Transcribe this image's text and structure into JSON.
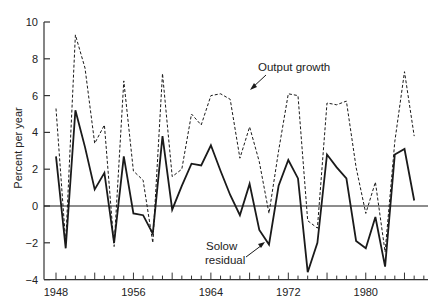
{
  "chart_data": {
    "type": "line",
    "title": "",
    "xlabel": "",
    "ylabel": "Percent per year",
    "xlim": [
      1948,
      1986
    ],
    "ylim": [
      -4,
      10
    ],
    "yticks": [
      -4,
      -2,
      0,
      2,
      4,
      6,
      8,
      10
    ],
    "xticks_labeled": [
      1948,
      1956,
      1964,
      1972,
      1980
    ],
    "grid": false,
    "zero_line": true,
    "legend_position": "inline annotations",
    "annotations": [
      {
        "text": "Output growth",
        "points_to": "dashed series"
      },
      {
        "text": "Solow\nresidual",
        "points_to": "solid series"
      }
    ],
    "x": [
      1948,
      1949,
      1950,
      1951,
      1952,
      1953,
      1954,
      1955,
      1956,
      1957,
      1958,
      1959,
      1960,
      1961,
      1962,
      1963,
      1964,
      1965,
      1966,
      1967,
      1968,
      1969,
      1970,
      1971,
      1972,
      1973,
      1974,
      1975,
      1976,
      1977,
      1978,
      1979,
      1980,
      1981,
      1982,
      1983,
      1984,
      1985
    ],
    "series": [
      {
        "name": "Output growth",
        "style": "dashed",
        "values": [
          5.3,
          -2.0,
          9.3,
          7.5,
          3.4,
          4.4,
          -2.2,
          6.8,
          1.9,
          1.4,
          -2.0,
          7.2,
          1.6,
          2.0,
          5.0,
          4.4,
          6.0,
          6.1,
          5.8,
          2.6,
          4.3,
          2.4,
          -0.4,
          3.0,
          6.1,
          6.0,
          -0.8,
          -1.2,
          5.6,
          5.5,
          5.7,
          2.1,
          -0.4,
          1.3,
          -2.5,
          3.5,
          7.3,
          3.8
        ]
      },
      {
        "name": "Solow residual",
        "style": "solid",
        "values": [
          2.7,
          -2.3,
          5.2,
          3.2,
          0.9,
          1.8,
          -2.0,
          2.7,
          -0.4,
          -0.5,
          -1.5,
          3.8,
          -0.2,
          1.1,
          2.3,
          2.2,
          3.3,
          1.9,
          0.6,
          -0.5,
          1.2,
          -1.3,
          -2.1,
          1.1,
          2.5,
          1.5,
          -3.6,
          -2.0,
          2.8,
          2.1,
          1.5,
          -1.9,
          -2.3,
          -0.6,
          -3.3,
          2.8,
          3.1,
          0.3
        ]
      }
    ]
  },
  "axes": {
    "y_label": "Percent per year",
    "y_tick_labels": [
      "10",
      "8",
      "6",
      "4",
      "2",
      "0",
      "−2",
      "−4"
    ],
    "x_tick_labels": [
      "1948",
      "1956",
      "1964",
      "1972",
      "1980"
    ]
  },
  "annotations": {
    "output_growth": "Output growth",
    "solow_line1": "Solow",
    "solow_line2": "residual"
  },
  "colors": {
    "line": "#1a1a1a",
    "axis": "#333333",
    "background": "#ffffff"
  }
}
